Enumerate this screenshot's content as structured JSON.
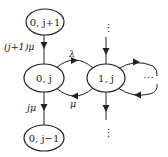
{
  "diagram": {
    "type": "state-transition",
    "nodes": [
      {
        "id": "n0jp1",
        "label": "0, j+1"
      },
      {
        "id": "n0j",
        "label": "0, j"
      },
      {
        "id": "n0jm1",
        "label": "0, j−1"
      },
      {
        "id": "n1j",
        "label": "1, j"
      }
    ],
    "edges": [
      {
        "from": "n0jp1",
        "to": "n0j",
        "label": "(j+1)μ"
      },
      {
        "from": "n0j",
        "to": "n0jm1",
        "label": "jμ"
      },
      {
        "from": "n0j",
        "to": "n1j",
        "label": "λ"
      },
      {
        "from": "n1j",
        "to": "n0j",
        "label": "μ"
      },
      {
        "from": "above",
        "to": "n1j",
        "label": ""
      },
      {
        "from": "n1j",
        "to": "below",
        "label": ""
      },
      {
        "from": "n1j",
        "to": "right",
        "label": ""
      },
      {
        "from": "right",
        "to": "n1j",
        "label": ""
      }
    ],
    "ellipsis": {
      "vertical": "⋮",
      "horizontal": "⋯"
    }
  }
}
